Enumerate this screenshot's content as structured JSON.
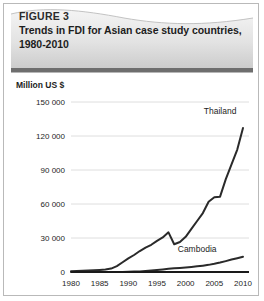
{
  "figure": {
    "number_label": "FIGURE 3",
    "title": "Trends in FDI for Asian case study countries, 1980-2010",
    "header_bg_light": "#f0f0f0",
    "header_bg_dark": "#c8c8c8",
    "divider_color": "#6e6e6e",
    "border_color": "#b9b9b9"
  },
  "chart_data": {
    "type": "line",
    "title": "Trends in FDI for Asian case study countries, 1980-2010",
    "xlabel": "",
    "ylabel": "Million US $",
    "unit_label": "Million US $",
    "xlim": [
      1980,
      2010
    ],
    "ylim": [
      0,
      150000
    ],
    "grid": true,
    "legend_position": "inline-labels",
    "xticks": [
      1980,
      1985,
      1990,
      1995,
      2000,
      2005,
      2010
    ],
    "xtick_labels": [
      "1980",
      "1985",
      "1990",
      "1995",
      "2000",
      "2005",
      "2010"
    ],
    "yticks": [
      0,
      30000,
      60000,
      90000,
      120000,
      150000
    ],
    "ytick_labels": [
      "0",
      "30 000",
      "60 000",
      "90 000",
      "120 000",
      "150 000"
    ],
    "x": [
      1980,
      1981,
      1982,
      1983,
      1984,
      1985,
      1986,
      1987,
      1988,
      1989,
      1990,
      1991,
      1992,
      1993,
      1994,
      1995,
      1996,
      1997,
      1998,
      1999,
      2000,
      2001,
      2002,
      2003,
      2004,
      2005,
      2006,
      2007,
      2008,
      2009,
      2010
    ],
    "series": [
      {
        "name": "Thailand",
        "label": "Thailand",
        "color": "#2a2a2a",
        "label_x": 2006,
        "label_y": 139000,
        "values": [
          600,
          900,
          1100,
          1300,
          1500,
          1800,
          2200,
          3000,
          5200,
          8600,
          12000,
          15000,
          18500,
          21500,
          24000,
          27500,
          30500,
          35000,
          24500,
          26500,
          31000,
          38000,
          45000,
          52000,
          62000,
          66000,
          66500,
          82000,
          95000,
          108000,
          127000
        ]
      },
      {
        "name": "Cambodia",
        "label": "Cambodia",
        "color": "#2a2a2a",
        "label_x": 2002,
        "label_y": 17500,
        "values": [
          0,
          0,
          0,
          0,
          0,
          0,
          0,
          0,
          0,
          100,
          200,
          350,
          550,
          900,
          1300,
          1800,
          2300,
          2800,
          3200,
          3600,
          4000,
          4500,
          5000,
          5600,
          6300,
          7200,
          8300,
          9600,
          11000,
          12200,
          13500
        ]
      }
    ]
  }
}
